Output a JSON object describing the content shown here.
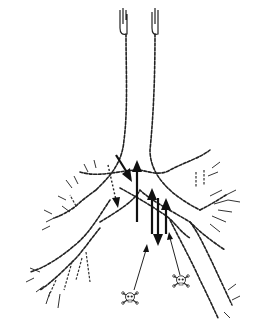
{
  "figure": {
    "colors": {
      "background": "#ffffff",
      "ink": "#222222"
    },
    "elements": {
      "hooks": 2,
      "main_chains": 2,
      "bold_arrows_up": 3,
      "bold_arrows_down": 2,
      "dotted_arrows": 1,
      "thin_pointer_arrows": 2,
      "skull_symbols": 2
    }
  }
}
